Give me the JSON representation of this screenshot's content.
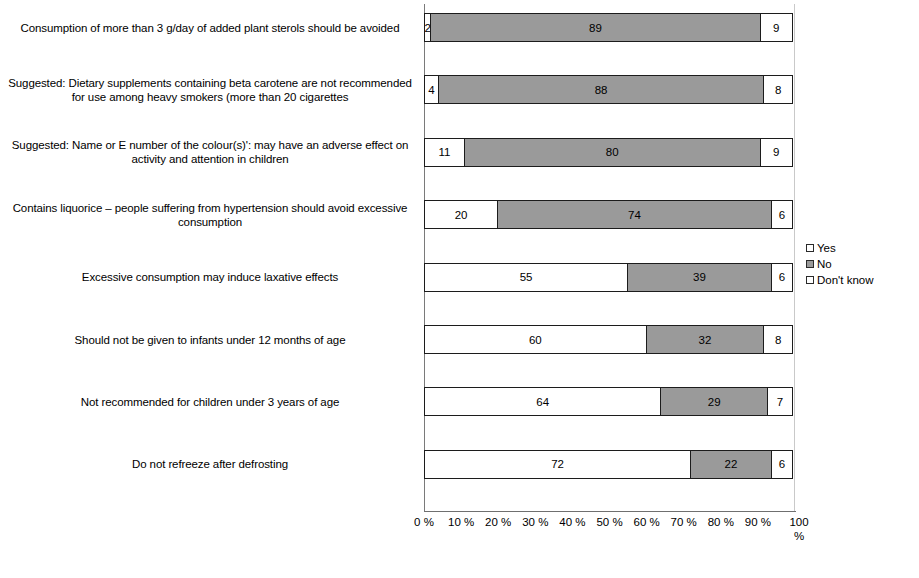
{
  "chart_data": {
    "type": "bar",
    "orientation": "horizontal",
    "stacked": true,
    "title": "",
    "subtitle": "",
    "xlabel": "%",
    "ylabel": "",
    "xlim": [
      0,
      100
    ],
    "grid": false,
    "legend_position": "right",
    "categories": [
      "Consumption of more than 3 g/day of added plant sterols should be avoided",
      "Suggested: Dietary supplements containing beta carotene are not recommended for use among heavy smokers (more than 20 cigarettes",
      "Suggested: Name or E number of the colour(s)': may have an adverse effect on activity and attention in children",
      "Contains liquorice – people suffering from hypertension should avoid excessive consumption",
      "Excessive consumption may induce laxative effects",
      "Should not be given to infants under 12 months of age",
      "Not recommended for children under 3 years of age",
      "Do not refreeze after defrosting"
    ],
    "series": [
      {
        "name": "Yes",
        "color": "#ffffff",
        "values": [
          2,
          4,
          11,
          20,
          55,
          60,
          64,
          72
        ]
      },
      {
        "name": "No",
        "color": "#9a9a9a",
        "values": [
          89,
          88,
          80,
          74,
          39,
          32,
          29,
          22
        ]
      },
      {
        "name": "Don't know",
        "color": "#ffffff",
        "values": [
          9,
          8,
          9,
          6,
          6,
          8,
          7,
          6
        ]
      }
    ],
    "xtick_labels": [
      "0 %",
      "10 %",
      "20 %",
      "30 %",
      "40 %",
      "50 %",
      "60 %",
      "70 %",
      "80 %",
      "90 %",
      "100 %"
    ],
    "xtick_values": [
      0,
      10,
      20,
      30,
      40,
      50,
      60,
      70,
      80,
      90,
      100
    ]
  },
  "legend": {
    "items": [
      {
        "label": "Yes"
      },
      {
        "label": "No"
      },
      {
        "label": "Don't know"
      }
    ]
  }
}
